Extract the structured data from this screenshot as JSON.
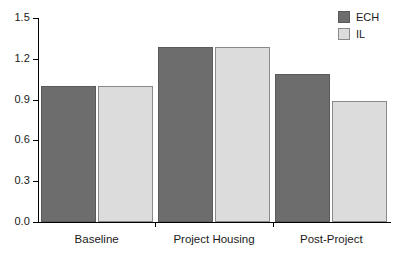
{
  "chart_data": {
    "type": "bar",
    "title": "",
    "subtitle": "",
    "xlabel": "",
    "ylabel": "",
    "grid": false,
    "legend_position": "top-right",
    "categories": [
      "Baseline",
      "Project Housing",
      "Post-Project"
    ],
    "ylim": [
      0.0,
      1.5
    ],
    "ytick_labels": [
      "0.0",
      "0.3",
      "0.6",
      "0.9",
      "1.2",
      "1.5"
    ],
    "ytick_values": [
      0.0,
      0.3,
      0.6,
      0.9,
      1.2,
      1.5
    ],
    "series": [
      {
        "name": "ECH",
        "color": "#6d6d6d",
        "values": [
          1.0,
          1.29,
          1.09
        ]
      },
      {
        "name": "IL",
        "color": "#dcdcdc",
        "values": [
          1.0,
          1.29,
          0.89
        ]
      }
    ]
  },
  "legend": {
    "items": [
      {
        "label": "ECH",
        "swatch": "legend-swatch-ech"
      },
      {
        "label": "IL",
        "swatch": "legend-swatch-il"
      }
    ]
  },
  "colors": {
    "series_ech": "#6d6d6d",
    "series_il": "#dcdcdc",
    "axis": "#000000",
    "text": "#1a1a1a",
    "background": "#ffffff"
  }
}
